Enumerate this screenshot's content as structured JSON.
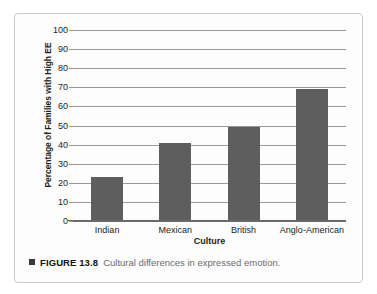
{
  "figure": {
    "caption_bullet": "square-bullet",
    "caption_label": "FIGURE 13.8",
    "caption_text": "Cultural differences in expressed emotion."
  },
  "chart_data": {
    "type": "bar",
    "title": "",
    "categories": [
      "Indian",
      "Mexican",
      "British",
      "Anglo-American"
    ],
    "values": [
      23,
      41,
      49,
      69
    ],
    "xlabel": "Culture",
    "ylabel": "Percentage of Families with High EE",
    "ylim": [
      0,
      100
    ],
    "ytick_step": 10,
    "yticks": [
      0,
      10,
      20,
      30,
      40,
      50,
      60,
      70,
      80,
      90,
      100
    ],
    "ytick_labels": [
      "0",
      "10",
      "20",
      "30",
      "40",
      "50",
      "60",
      "70",
      "80",
      "90",
      "100"
    ],
    "grid": true,
    "grid_axis": "y",
    "legend": false,
    "bar_color": "#5e5e5e",
    "gridline_color": "#9a9a9a",
    "axis_color": "#6a6a6a",
    "background_color": "#fdfdfd",
    "border_color": "#c9c9c9"
  }
}
